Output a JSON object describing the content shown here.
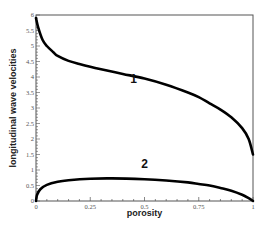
{
  "chart_data": {
    "type": "line",
    "title": "",
    "xlabel": "porosity",
    "ylabel": "longitudinal wave velocities",
    "xlim": [
      0,
      1
    ],
    "ylim": [
      0,
      6
    ],
    "grid": false,
    "legend": null,
    "x_ticks": [
      "0",
      "0.25",
      "0.5",
      "0.75",
      "1"
    ],
    "y_ticks": [
      "0",
      "0.5",
      "1",
      "1.5",
      "2",
      "2.5",
      "3",
      "3.5",
      "4",
      "4.5",
      "5",
      "5.5",
      "6"
    ],
    "series": [
      {
        "name": "1",
        "x": [
          0,
          0.01,
          0.03,
          0.05,
          0.08,
          0.1,
          0.15,
          0.2,
          0.25,
          0.3,
          0.4,
          0.5,
          0.6,
          0.7,
          0.75,
          0.8,
          0.85,
          0.9,
          0.95,
          0.98,
          1.0
        ],
        "y": [
          5.9,
          5.6,
          5.2,
          5.0,
          4.8,
          4.68,
          4.52,
          4.42,
          4.33,
          4.25,
          4.1,
          3.95,
          3.75,
          3.5,
          3.35,
          3.15,
          2.95,
          2.7,
          2.35,
          2.0,
          1.5
        ]
      },
      {
        "name": "2",
        "x": [
          0,
          0.005,
          0.02,
          0.05,
          0.1,
          0.15,
          0.25,
          0.35,
          0.5,
          0.6,
          0.7,
          0.75,
          0.8,
          0.85,
          0.9,
          0.95,
          0.98,
          1.0
        ],
        "y": [
          0,
          0.2,
          0.38,
          0.52,
          0.62,
          0.67,
          0.72,
          0.73,
          0.7,
          0.66,
          0.6,
          0.55,
          0.5,
          0.42,
          0.33,
          0.2,
          0.09,
          0
        ]
      }
    ],
    "annotations": [
      {
        "text": "1",
        "x": 0.45,
        "y": 3.8
      },
      {
        "text": "2",
        "x": 0.5,
        "y": 1.05
      }
    ]
  }
}
